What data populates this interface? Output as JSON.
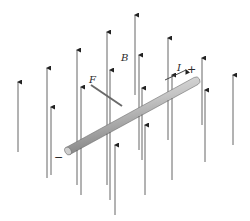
{
  "diagram": {
    "labels": {
      "field": "B",
      "force": "F",
      "current": "I",
      "positive_terminal": "+",
      "negative_terminal": "−"
    },
    "colors": {
      "field_line": "#555555",
      "arrowhead": "#222222",
      "rod_light": "#e6e6e6",
      "rod_mid": "#b5b5b5",
      "rod_dark": "#7a7a7a",
      "force_arrow": "#6a6a6a"
    },
    "field_arrows": [
      {
        "x": 18,
        "top": 82,
        "bottom": 152
      },
      {
        "x": 47,
        "top": 68,
        "bottom": 178
      },
      {
        "x": 51,
        "top": 107,
        "bottom": 175
      },
      {
        "x": 77,
        "top": 50,
        "bottom": 185
      },
      {
        "x": 81,
        "top": 87,
        "bottom": 195
      },
      {
        "x": 107,
        "top": 32,
        "bottom": 185
      },
      {
        "x": 110,
        "top": 70,
        "bottom": 200
      },
      {
        "x": 115,
        "top": 145,
        "bottom": 215
      },
      {
        "x": 135,
        "top": 15,
        "bottom": 95
      },
      {
        "x": 139,
        "top": 55,
        "bottom": 150
      },
      {
        "x": 142,
        "top": 88,
        "bottom": 160
      },
      {
        "x": 145,
        "top": 125,
        "bottom": 195
      },
      {
        "x": 168,
        "top": 38,
        "bottom": 140
      },
      {
        "x": 172,
        "top": 75,
        "bottom": 180
      },
      {
        "x": 202,
        "top": 58,
        "bottom": 125
      },
      {
        "x": 205,
        "top": 90,
        "bottom": 162
      },
      {
        "x": 233,
        "top": 75,
        "bottom": 145
      }
    ],
    "rod": {
      "x1": 68,
      "y1": 151,
      "x2": 196,
      "y2": 81
    },
    "force_arrow": {
      "x1": 122,
      "y1": 106,
      "x2": 91,
      "y2": 85
    },
    "current_arrow": {
      "x1": 165,
      "y1": 80,
      "x2": 186,
      "y2": 70
    }
  }
}
